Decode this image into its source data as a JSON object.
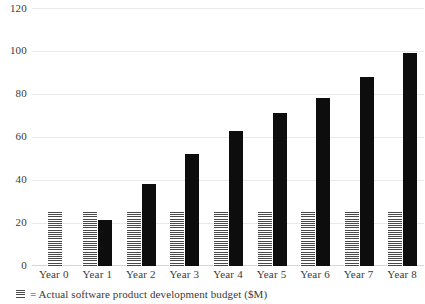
{
  "chart_data": {
    "type": "bar",
    "title": "",
    "xlabel": "",
    "ylabel": "",
    "ylim": [
      0,
      120
    ],
    "yticks": [
      0,
      20,
      40,
      60,
      80,
      100,
      120
    ],
    "ytick_labels": [
      "0",
      "20",
      "40",
      "60",
      "80",
      "100",
      "120"
    ],
    "grid": true,
    "legend_position": "below-left",
    "categories": [
      "Year 0",
      "Year 1",
      "Year 2",
      "Year 3",
      "Year 4",
      "Year 5",
      "Year 6",
      "Year 7",
      "Year 8"
    ],
    "series": [
      {
        "name": "Planned budget",
        "style": "hatched",
        "color": "#4a4a4a",
        "values": [
          25,
          25,
          25,
          25,
          25,
          25,
          25,
          25,
          25
        ]
      },
      {
        "name": "= Actual software product development budget ($M)",
        "style": "solid",
        "color": "#0d0d0d",
        "values": [
          null,
          21.5,
          38,
          52,
          63,
          71,
          78,
          88,
          99
        ]
      }
    ],
    "legend": [
      {
        "marker": "hatched-swatch",
        "label": "= Actual software product development budget ($M)"
      }
    ]
  }
}
